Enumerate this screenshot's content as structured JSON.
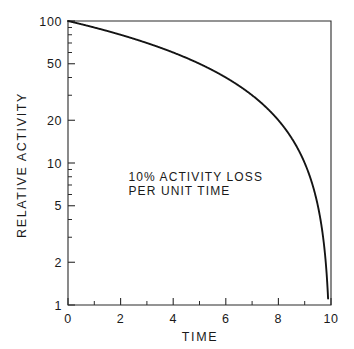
{
  "chart_data": {
    "type": "line",
    "title": "",
    "subtitle": "",
    "xlabel": "TIME",
    "ylabel": "RELATIVE ACTIVITY",
    "xlim": [
      0,
      10
    ],
    "ylim": [
      1,
      100
    ],
    "yscale": "log",
    "xscale": "linear",
    "grid": false,
    "legend": null,
    "xticks": [
      0,
      2,
      4,
      6,
      8,
      10
    ],
    "xtick_labels": [
      "0",
      "2",
      "4",
      "6",
      "8",
      "10"
    ],
    "xminor_ticks": [
      1,
      3,
      5,
      7,
      9
    ],
    "yticks": [
      1,
      2,
      5,
      10,
      20,
      50,
      100
    ],
    "ytick_labels": [
      "1",
      "2",
      "5",
      "10",
      "20",
      "50",
      "100"
    ],
    "yminor_ticks": [
      3,
      4,
      6,
      7,
      8,
      9,
      30,
      40,
      60,
      70,
      80,
      90
    ],
    "annotations": [
      {
        "line1": "10% ACTIVITY LOSS",
        "line2": "PER UNIT TIME",
        "x": 2.3,
        "y": 7.5
      }
    ],
    "series": [
      {
        "name": "Relative activity",
        "color": "#141414",
        "x": [
          0,
          0.25,
          0.5,
          0.75,
          1,
          1.5,
          2,
          2.5,
          3,
          3.5,
          4,
          4.5,
          5,
          5.5,
          6,
          6.5,
          7,
          7.5,
          8,
          8.5,
          8.75,
          9,
          9.2,
          9.4,
          9.5,
          9.6,
          9.7,
          9.8,
          9.85,
          9.9
        ],
        "y": [
          100,
          97.5,
          95,
          92.5,
          90,
          85,
          80,
          75,
          70,
          65,
          60,
          55,
          50,
          45,
          40,
          35,
          30,
          25,
          20,
          15,
          12.5,
          10,
          8,
          6,
          5,
          4,
          3,
          2,
          1.5,
          1
        ]
      }
    ],
    "model": "relative_activity = 100 * (1 - 0.1 * t)",
    "axis_colors": {
      "frame": "#2b2b2b",
      "curve": "#141414",
      "text": "#1a1a1a",
      "background": "#ffffff"
    }
  },
  "labels": {
    "y_axis_title": "RELATIVE ACTIVITY",
    "x_axis_title": "TIME",
    "annotation_line_1": "10% ACTIVITY LOSS",
    "annotation_line_2": "PER UNIT TIME"
  }
}
